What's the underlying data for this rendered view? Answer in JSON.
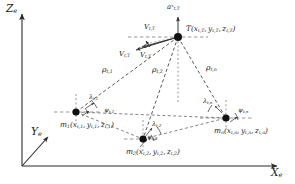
{
  "figure": {
    "title_semantic": "3d-target-tracking-geometry-diagram",
    "background_color": "#ffffff",
    "line_color": "#2b2b2b",
    "text_color": "#1a1a1a"
  },
  "axes": {
    "z": {
      "label": "Z",
      "subscript": "e"
    },
    "y": {
      "label": "Y",
      "subscript": "e"
    },
    "x": {
      "label": "X",
      "subscript": "e"
    }
  },
  "target": {
    "name": "T",
    "label_main": "T(x",
    "label_full": "T(x t,T , y t,T , z t,T )",
    "symbol": "T",
    "coords": [
      {
        "var": "x",
        "sub": "t,T"
      },
      {
        "var": "y",
        "sub": "t,T"
      },
      {
        "var": "z",
        "sub": "t,T"
      }
    ],
    "acceleration": {
      "symbol": "a",
      "sub": "t,T",
      "sup": "x"
    },
    "velocities": [
      {
        "symbol": "V",
        "sub": "t,T"
      },
      {
        "symbol": "V",
        "sub": "t,T"
      },
      {
        "symbol": "V",
        "sub": "t,T"
      }
    ]
  },
  "stations": [
    {
      "id": "m1",
      "symbol": "m",
      "sub": "1",
      "coords": [
        {
          "var": "x",
          "sub": "t,1"
        },
        {
          "var": "y",
          "sub": "t,1"
        },
        {
          "var": "z",
          "sub": "t,1"
        }
      ],
      "range": {
        "symbol": "ρ",
        "sub": "t,1"
      },
      "elevation": {
        "symbol": "λ",
        "sub": "t,1"
      },
      "azimuth": {
        "symbol": "ψ",
        "sub": "t,1"
      }
    },
    {
      "id": "m2",
      "symbol": "m",
      "sub": "2",
      "coords": [
        {
          "var": "x",
          "sub": "t,2"
        },
        {
          "var": "y",
          "sub": "t,2"
        },
        {
          "var": "z",
          "sub": "t,2"
        }
      ],
      "range": {
        "symbol": "ρ",
        "sub": "t,2"
      },
      "elevation": {
        "symbol": "λ",
        "sub": "t,2"
      },
      "azimuth": {
        "symbol": "ψ",
        "sub": "t,2"
      }
    },
    {
      "id": "mn",
      "symbol": "m",
      "sub": "n",
      "coords": [
        {
          "var": "x",
          "sub": "t,n"
        },
        {
          "var": "y",
          "sub": "t,n"
        },
        {
          "var": "z",
          "sub": "t,n"
        }
      ],
      "range": {
        "symbol": "ρ",
        "sub": "t,n"
      },
      "elevation": {
        "symbol": "λ",
        "sub": "t,n"
      },
      "azimuth": {
        "symbol": "ψ",
        "sub": "t,n"
      }
    }
  ]
}
